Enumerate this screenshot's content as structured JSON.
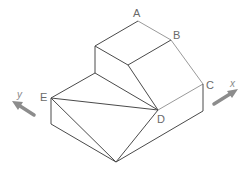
{
  "diagram": {
    "type": "isometric-solid",
    "points": {
      "A": {
        "label": "A"
      },
      "B": {
        "label": "B"
      },
      "C": {
        "label": "C"
      },
      "D": {
        "label": "D"
      },
      "E": {
        "label": "E"
      }
    },
    "axes": {
      "x": {
        "label": "x"
      },
      "y": {
        "label": "y"
      }
    },
    "colors": {
      "edge_dark": "#4a4a4a",
      "edge_light": "#9a9a9a",
      "arrow": "#8c8c8c",
      "label": "#6a6a6a"
    }
  }
}
